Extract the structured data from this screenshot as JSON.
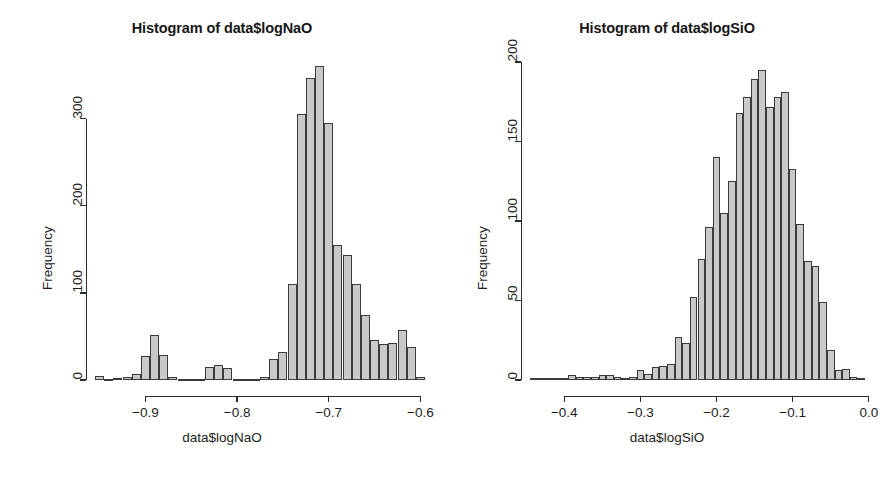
{
  "figure": {
    "background_color": "#ffffff",
    "bar_fill_color": "#c9c9c9",
    "bar_border_color": "#3b3b3b",
    "axis_color": "#2b2b2b"
  },
  "panels": [
    {
      "id": "left",
      "title": "Histogram of data$logNaO",
      "xlabel": "data$logNaO",
      "ylabel": "Frequency"
    },
    {
      "id": "right",
      "title": "Histogram of data$logSiO",
      "xlabel": "data$logSiO",
      "ylabel": "Frequency"
    }
  ],
  "chart_data": [
    {
      "type": "bar",
      "subtype": "histogram",
      "title": "Histogram of data$logNaO",
      "xlabel": "data$logNaO",
      "ylabel": "Frequency",
      "xlim": [
        -0.955,
        -0.595
      ],
      "ylim": [
        0,
        365
      ],
      "xticks": [
        -0.9,
        -0.8,
        -0.7,
        -0.6
      ],
      "xticklabels": [
        "-0.9",
        "-0.8",
        "-0.7",
        "-0.6"
      ],
      "yticks": [
        0,
        100,
        200,
        300
      ],
      "yticklabels": [
        "0",
        "100",
        "200",
        "300"
      ],
      "grid": false,
      "legend": null,
      "bin_width": 0.01,
      "bin_starts": [
        -0.955,
        -0.945,
        -0.935,
        -0.925,
        -0.915,
        -0.905,
        -0.895,
        -0.885,
        -0.875,
        -0.865,
        -0.855,
        -0.845,
        -0.835,
        -0.825,
        -0.815,
        -0.805,
        -0.795,
        -0.785,
        -0.775,
        -0.765,
        -0.755,
        -0.745,
        -0.735,
        -0.725,
        -0.715,
        -0.705,
        -0.695,
        -0.685,
        -0.675,
        -0.665,
        -0.655,
        -0.645,
        -0.635,
        -0.625,
        -0.615,
        -0.605
      ],
      "values": [
        5,
        0,
        2,
        4,
        7,
        28,
        52,
        29,
        3,
        1,
        0,
        0,
        15,
        17,
        14,
        0,
        0,
        0,
        4,
        24,
        32,
        110,
        305,
        347,
        360,
        295,
        155,
        143,
        110,
        75,
        46,
        41,
        43,
        57,
        38,
        4
      ]
    },
    {
      "type": "bar",
      "subtype": "histogram",
      "title": "Histogram of data$logSiO",
      "xlabel": "data$logSiO",
      "ylabel": "Frequency",
      "xlim": [
        -0.445,
        -0.005
      ],
      "ylim": [
        0,
        200
      ],
      "xticks": [
        -0.4,
        -0.3,
        -0.2,
        -0.1,
        0.0
      ],
      "xticklabels": [
        "-0.4",
        "-0.3",
        "-0.2",
        "-0.1",
        "0.0"
      ],
      "yticks": [
        0,
        50,
        100,
        150,
        200
      ],
      "yticklabels": [
        "0",
        "50",
        "100",
        "150",
        "200"
      ],
      "grid": false,
      "legend": null,
      "bin_width": 0.01,
      "bin_starts": [
        -0.445,
        -0.435,
        -0.425,
        -0.415,
        -0.405,
        -0.395,
        -0.385,
        -0.375,
        -0.365,
        -0.355,
        -0.345,
        -0.335,
        -0.325,
        -0.315,
        -0.305,
        -0.295,
        -0.285,
        -0.275,
        -0.265,
        -0.255,
        -0.245,
        -0.235,
        -0.225,
        -0.215,
        -0.205,
        -0.195,
        -0.185,
        -0.175,
        -0.165,
        -0.155,
        -0.145,
        -0.135,
        -0.125,
        -0.115,
        -0.105,
        -0.095,
        -0.085,
        -0.075,
        -0.065,
        -0.055,
        -0.045,
        -0.035,
        -0.025,
        -0.015
      ],
      "values": [
        1,
        1,
        1,
        1,
        1,
        3,
        2,
        2,
        2,
        3,
        3,
        2,
        1,
        2,
        6,
        4,
        8,
        9,
        10,
        27,
        23,
        52,
        76,
        96,
        140,
        105,
        125,
        168,
        178,
        189,
        195,
        172,
        178,
        181,
        133,
        98,
        75,
        72,
        49,
        19,
        6,
        7,
        2,
        1
      ]
    }
  ]
}
